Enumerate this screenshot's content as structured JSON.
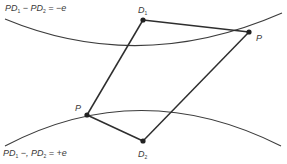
{
  "diagram": {
    "equations": {
      "top": {
        "pd1": "PD",
        "pd1_sub": "1",
        "mid": " − PD",
        "pd2_sub": "2",
        "rhs": " = −e"
      },
      "bottom": {
        "pd1": "PD",
        "pd1_sub": "1",
        "mid": " −, PD",
        "pd2_sub": "2",
        "rhs": " = +e"
      }
    },
    "points": {
      "d1": {
        "label": "D",
        "sub": "1",
        "x": 143,
        "y": 20
      },
      "d2": {
        "label": "D",
        "sub": "2",
        "x": 143,
        "y": 141
      },
      "p_right": {
        "label": "P",
        "x": 249,
        "y": 32
      },
      "p_left": {
        "label": "P",
        "x": 87,
        "y": 115
      }
    },
    "colors": {
      "line": "#2e2e2e",
      "curve": "#3c3c3c",
      "text": "#3a3a3a"
    }
  }
}
